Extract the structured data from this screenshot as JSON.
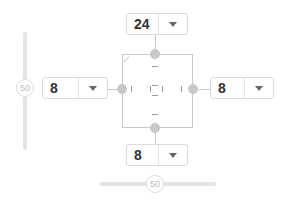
{
  "margin_control": {
    "top": {
      "value": "24"
    },
    "left": {
      "value": "8"
    },
    "right": {
      "value": "8"
    },
    "bottom": {
      "value": "8"
    }
  },
  "sliders": {
    "vertical": {
      "value": "50"
    },
    "horizontal": {
      "value": "50"
    }
  },
  "colors": {
    "border": "#dcdcdc",
    "handle": "#c8c8c8",
    "text": "#333333"
  }
}
